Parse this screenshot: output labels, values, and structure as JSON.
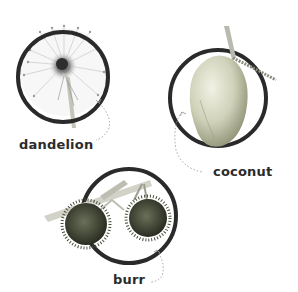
{
  "figure": {
    "items": [
      {
        "name": "dandelion",
        "label": "dandelion",
        "icon": "dandelion-icon"
      },
      {
        "name": "coconut",
        "label": "coconut",
        "icon": "coconut-icon"
      },
      {
        "name": "burr",
        "label": "burr",
        "icon": "burr-icon"
      }
    ],
    "colors": {
      "ring": "#2a2a2a",
      "label": "#2b2b2b",
      "arrow": "#9a9a9a",
      "coconut_light": "#e9ead8",
      "coconut_mid": "#c9cbb2",
      "coconut_dark": "#8f9175",
      "burr_dark": "#3e4232",
      "stem": "#c4c4b8"
    }
  }
}
